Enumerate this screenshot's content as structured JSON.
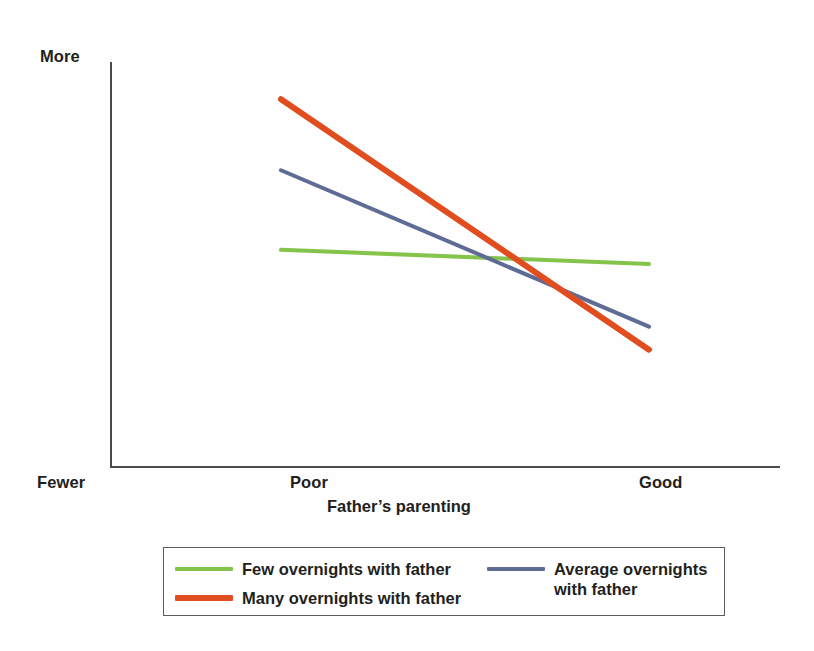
{
  "chart_data": {
    "type": "line",
    "title": "",
    "subtitle": "",
    "xlabel": "Father’s parenting",
    "ylabel": "Child mental health problems",
    "x_tick_labels": [
      "Poor",
      "Good"
    ],
    "y_tick_labels": [
      "Fewer",
      "More"
    ],
    "x": [
      "Poor",
      "Good"
    ],
    "xlim": [
      "Poor",
      "Good"
    ],
    "ylim": [
      "Fewer",
      "More"
    ],
    "grid": false,
    "legend_position": "bottom",
    "axis_style": "open-left-bottom",
    "series": [
      {
        "name": "Few overnights with father",
        "color": "#84c44b",
        "line_width": 4,
        "values": [
          0.535,
          0.5
        ],
        "points": [
          {
            "x": "Poor",
            "y": 0.535
          },
          {
            "x": "Good",
            "y": 0.5
          }
        ]
      },
      {
        "name": "Average overnights with father",
        "color": "#5e6b95",
        "line_width": 4,
        "values": [
          0.732,
          0.345
        ],
        "points": [
          {
            "x": "Poor",
            "y": 0.732
          },
          {
            "x": "Good",
            "y": 0.345
          }
        ]
      },
      {
        "name": "Many overnights with father",
        "color": "#e04e20",
        "line_width": 6,
        "values": [
          0.908,
          0.288
        ],
        "points": [
          {
            "x": "Poor",
            "y": 0.908
          },
          {
            "x": "Good",
            "y": 0.288
          }
        ]
      }
    ]
  },
  "axes": {
    "y_top_label": "More",
    "y_bottom_label": "Fewer",
    "y_title": "Child mental health problems",
    "x_title": "Father’s parenting",
    "x_tick_low": "Poor",
    "x_tick_high": "Good"
  },
  "legend": {
    "items": [
      {
        "label": "Few overnights with father",
        "color": "#84c44b"
      },
      {
        "label": "Many overnights with father",
        "color": "#e04e20"
      },
      {
        "label": "Average overnights\nwith father",
        "color": "#5e6b95"
      }
    ]
  },
  "colors": {
    "green": "#84c44b",
    "blue": "#5e6b95",
    "orange": "#e04e20",
    "axis": "#4a4a4a",
    "text": "#231f20",
    "legend_border": "#5d5d5d",
    "background": "#fefefe"
  }
}
